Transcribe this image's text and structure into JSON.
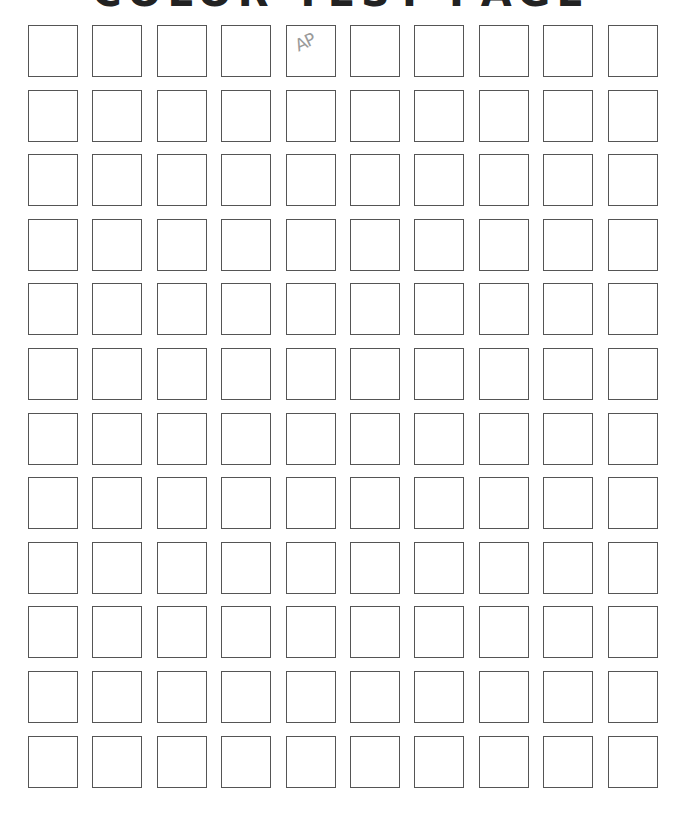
{
  "page": {
    "title": "COLOR TEST PAGE",
    "grid": {
      "rows": 12,
      "columns": 10
    },
    "annotations": [
      {
        "row": 0,
        "col": 4,
        "text": "AP"
      }
    ],
    "colors": {
      "border": "#555555",
      "background": "#ffffff",
      "annotation": "#9a9a9a"
    }
  }
}
